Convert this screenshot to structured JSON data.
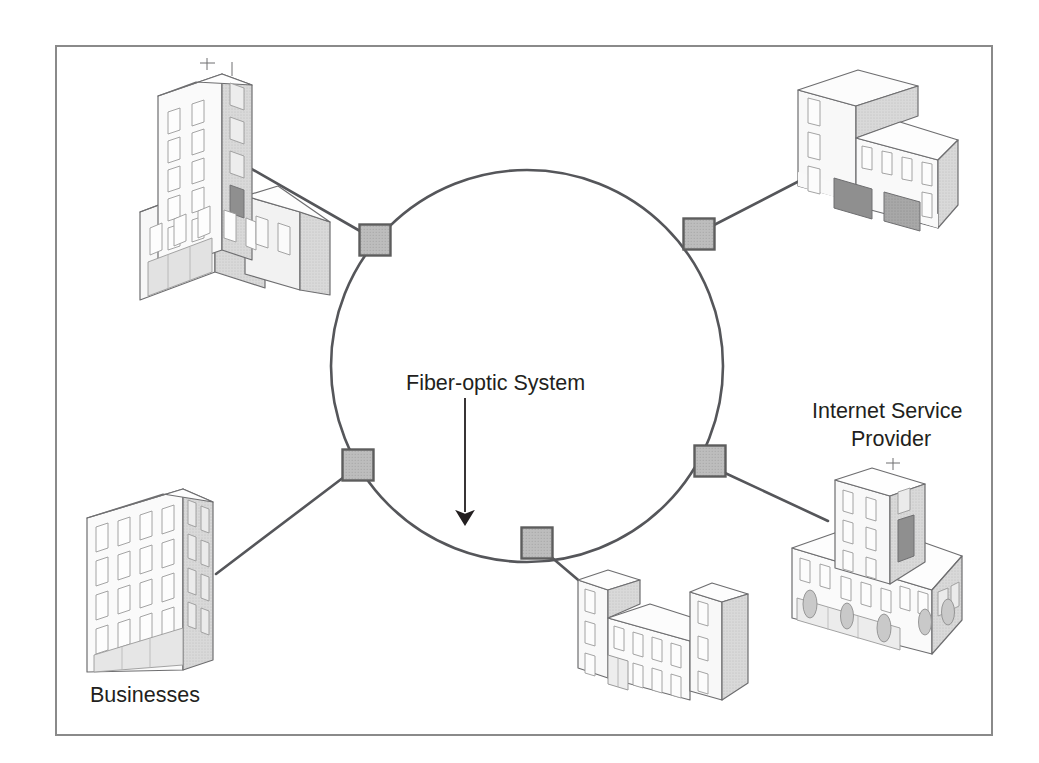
{
  "figure": {
    "kind": "network-topology-diagram",
    "background_color": "#ffffff",
    "frame": {
      "x": 55,
      "y": 45,
      "width": 937,
      "height": 690,
      "border_color": "#8a8a8a",
      "border_width": 2
    }
  },
  "labels": {
    "fiber_optic_system": "Fiber-optic System",
    "businesses": "Businesses",
    "internet_service_provider_line1": "Internet Service",
    "internet_service_provider_line2": "Provider"
  },
  "ring": {
    "name": "fiber-optic-ring",
    "center_x": 527,
    "center_y": 366,
    "radius": 196,
    "stroke_color": "#55565a",
    "stroke_width": 2.6,
    "fill": "none"
  },
  "annotation_arrow": {
    "name": "fiber-optic-system-arrow",
    "x": 465,
    "y_start": 398,
    "y_end": 528,
    "color": "#231f20",
    "stroke_width": 1.8,
    "head_width": 11,
    "head_length": 20
  },
  "nodes": [
    {
      "id": "node-nw",
      "label": "node-northwest",
      "x": 375,
      "y": 240,
      "size": 31
    },
    {
      "id": "node-ne",
      "label": "node-northeast",
      "x": 699,
      "y": 234,
      "size": 31
    },
    {
      "id": "node-sw",
      "label": "node-southwest",
      "x": 358,
      "y": 465,
      "size": 31
    },
    {
      "id": "node-se",
      "label": "node-southeast",
      "x": 710,
      "y": 461,
      "size": 31
    },
    {
      "id": "node-s",
      "label": "node-south",
      "x": 537,
      "y": 543,
      "size": 31
    }
  ],
  "node_style": {
    "fill": "#b9b9b9",
    "stroke": "#5d5d5d",
    "stroke_width": 2.4
  },
  "links": [
    {
      "name": "link-node-nw-to-building-top-left",
      "x1": 360,
      "y1": 230,
      "x2": 242,
      "y2": 163
    },
    {
      "name": "link-node-ne-to-building-top-right",
      "x1": 714,
      "y1": 224,
      "x2": 806,
      "y2": 176
    },
    {
      "name": "link-node-sw-to-building-bottom-left",
      "x1": 344,
      "y1": 477,
      "x2": 215,
      "y2": 575
    },
    {
      "name": "link-node-se-to-building-isp",
      "x1": 725,
      "y1": 473,
      "x2": 827,
      "y2": 520
    },
    {
      "name": "link-node-s-to-building-bottom-center",
      "x1": 550,
      "y1": 556,
      "x2": 589,
      "y2": 589
    }
  ],
  "link_style": {
    "stroke": "#55565a",
    "stroke_width": 2.6
  },
  "buildings": [
    {
      "id": "building-top-left",
      "name": "building-top-left-tower",
      "description": "high-rise tower with lower annex",
      "associated_label": "Businesses"
    },
    {
      "id": "building-top-right",
      "name": "building-top-right-lshape",
      "description": "L-shaped low-rise office with garage doors",
      "associated_label": "Businesses"
    },
    {
      "id": "building-bottom-left",
      "name": "building-bottom-left-block",
      "description": "six-story rectangular office block",
      "associated_label": "Businesses"
    },
    {
      "id": "building-bottom-center",
      "name": "building-bottom-center-ushape",
      "description": "U-shaped building with two end towers",
      "associated_label": "Businesses"
    },
    {
      "id": "building-isp",
      "name": "building-internet-service-provider",
      "description": "central tower on wide low base with shrubs",
      "associated_label": "Internet Service Provider"
    }
  ],
  "palette": {
    "outline": "#6e6e70",
    "face_light": "#fbfbfb",
    "face_mid": "#ededed",
    "face_shaded": "#d6d6d6",
    "face_dark": "#8f8f8f",
    "window_fill": "#fdfdfd",
    "window_stroke": "#9a9a9a",
    "door_dark": "#8c8c8c",
    "text": "#231f20"
  }
}
